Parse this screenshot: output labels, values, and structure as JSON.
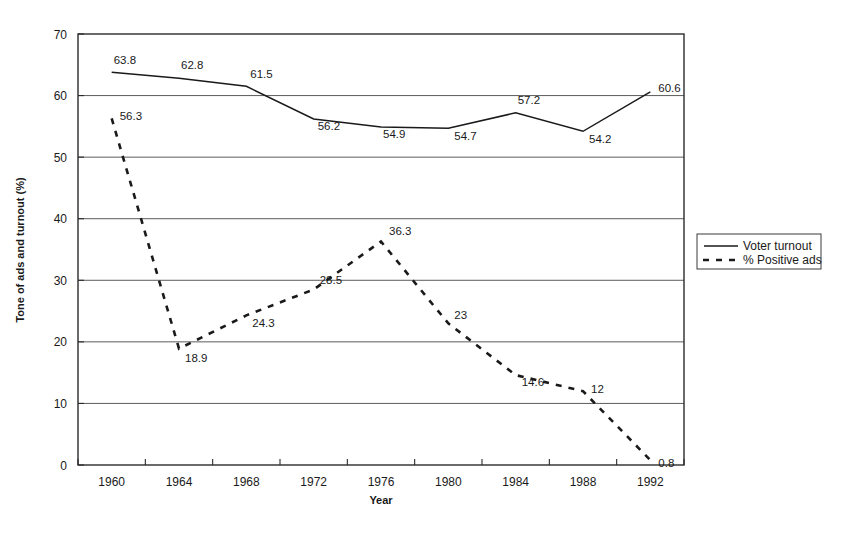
{
  "chart_data": {
    "type": "line",
    "title": "",
    "xlabel": "Year",
    "ylabel": "Tone of ads and turnout (%)",
    "categories": [
      "1960",
      "1964",
      "1968",
      "1972",
      "1976",
      "1980",
      "1984",
      "1988",
      "1992"
    ],
    "ylim": [
      0,
      70
    ],
    "yticks": [
      "0",
      "10",
      "20",
      "30",
      "40",
      "50",
      "60",
      "70"
    ],
    "grid": "horizontal",
    "legend_position": "right",
    "series": [
      {
        "name": "Voter turnout",
        "style": "solid",
        "values": [
          63.8,
          62.8,
          61.5,
          56.2,
          54.9,
          54.7,
          57.2,
          54.2,
          60.6
        ],
        "labels": [
          "63.8",
          "62.8",
          "61.5",
          "56.2",
          "54.9",
          "54.7",
          "57.2",
          "54.2",
          "60.6"
        ]
      },
      {
        "name": "% Positive ads",
        "style": "dashed",
        "values": [
          56.3,
          18.9,
          24.3,
          28.5,
          36.3,
          23,
          14.6,
          12,
          0.8
        ],
        "labels": [
          "56.3",
          "18.9",
          "24.3",
          "28.5",
          "36.3",
          "23",
          "14.6",
          "12",
          "0.8"
        ]
      }
    ]
  },
  "legend": {
    "entries": [
      {
        "label": "Voter turnout",
        "marker": "solid-line-icon"
      },
      {
        "label": "% Positive ads",
        "marker": "dashed-line-icon"
      }
    ]
  },
  "colors": {
    "series": "#1a1a1a",
    "grid": "#4a4a4a",
    "frame": "#2b2b2b",
    "background": "#ffffff"
  }
}
